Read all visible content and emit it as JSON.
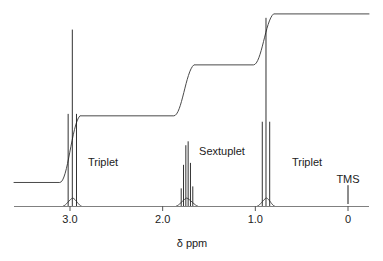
{
  "chart_data": {
    "type": "line",
    "title": "",
    "subtitle": "",
    "xlabel": "δ ppm",
    "ylabel": "",
    "xlim": [
      3.55,
      -0.35
    ],
    "ylim": [
      0,
      1
    ],
    "grid": false,
    "legend_position": "none",
    "x_ticks": [
      {
        "value": 3.0,
        "label": "3.0"
      },
      {
        "value": 2.0,
        "label": "2.0"
      },
      {
        "value": 1.0,
        "label": "1.0"
      },
      {
        "value": 0.0,
        "label": "0"
      }
    ],
    "annotations": [
      {
        "text": "Triplet",
        "x": 2.55,
        "y": 0.33
      },
      {
        "text": "Sextuplet",
        "x": 1.45,
        "y": 0.4
      },
      {
        "text": "Triplet",
        "x": 0.45,
        "y": 0.33
      },
      {
        "text": "TMS",
        "x": 0.0,
        "y": 0.22
      }
    ],
    "multiplets": [
      {
        "name": "triplet-a",
        "label": "Triplet",
        "center_ppm": 2.97,
        "multiplicity": 3,
        "lines": [
          {
            "ppm": 3.02,
            "height": 0.47
          },
          {
            "ppm": 2.975,
            "height": 0.9
          },
          {
            "ppm": 2.93,
            "height": 0.47
          }
        ]
      },
      {
        "name": "sextuplet",
        "label": "Sextuplet",
        "center_ppm": 1.74,
        "multiplicity": 6,
        "lines": [
          {
            "ppm": 1.8,
            "height": 0.09
          },
          {
            "ppm": 1.775,
            "height": 0.21
          },
          {
            "ppm": 1.75,
            "height": 0.31
          },
          {
            "ppm": 1.725,
            "height": 0.33
          },
          {
            "ppm": 1.7,
            "height": 0.22
          },
          {
            "ppm": 1.675,
            "height": 0.1
          }
        ]
      },
      {
        "name": "triplet-b",
        "label": "Triplet",
        "center_ppm": 0.88,
        "multiplicity": 3,
        "lines": [
          {
            "ppm": 0.925,
            "height": 0.43
          },
          {
            "ppm": 0.885,
            "height": 0.96
          },
          {
            "ppm": 0.845,
            "height": 0.43
          }
        ]
      }
    ],
    "tms_reference": {
      "label": "TMS",
      "ppm": 0.0,
      "height": 0.06
    },
    "integral_curve": {
      "description": "stepped integration trace rising left to right",
      "start_level": 0.12,
      "steps": [
        {
          "at_ppm": 2.97,
          "level_after": 0.46
        },
        {
          "at_ppm": 1.74,
          "level_after": 0.72
        },
        {
          "at_ppm": 0.88,
          "level_after": 0.98
        }
      ]
    }
  },
  "axis": {
    "x_title": "δ ppm"
  },
  "colors": {
    "peak": "#1a1a1a",
    "integral": "#4a4a4a",
    "axis": "#808080",
    "text": "#222222",
    "background": "#ffffff"
  }
}
